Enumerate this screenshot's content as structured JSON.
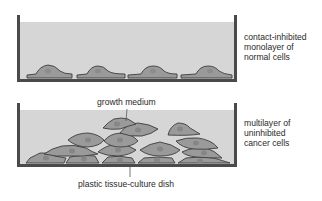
{
  "figure": {
    "panels": [
      {
        "id": "normal",
        "description": "dish with a single layer of flattened normal cells",
        "label_lines": [
          "contact-inhibited",
          "monolayer of",
          "normal cells"
        ]
      },
      {
        "id": "cancer",
        "description": "dish with piled-up, overlapping cancer cells",
        "label_lines": [
          "multilayer of",
          "uninhibited",
          "cancer cells"
        ]
      }
    ],
    "callouts": {
      "medium": "growth medium",
      "dish": "plastic tissue-culture dish"
    },
    "colors": {
      "dish_wall": "#4a4a4a",
      "medium": "#d6d6d6",
      "cell_fill": "#9a9a9a",
      "cell_outline": "#3d3d3d",
      "nucleus": "#8a8a8a",
      "text": "#2a2a2a"
    }
  }
}
